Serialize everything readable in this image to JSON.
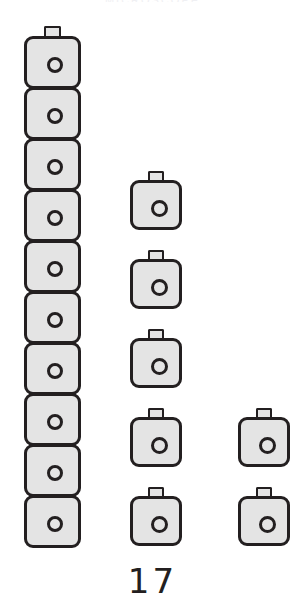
{
  "page": {
    "background_color": "#ffffff",
    "width": 305,
    "height": 613,
    "page_number": "17",
    "header_remnant": "MICROSCOPE"
  },
  "style": {
    "icon_fill": "#e4e4e4",
    "icon_stroke": "#231f20",
    "text_color": "#231f20"
  },
  "chart_data": {
    "type": "bar",
    "subtype": "pictograph",
    "title": "",
    "xlabel": "",
    "ylabel": "",
    "grid": false,
    "legend": null,
    "icon_name": "camera-icon",
    "icon_unit_value": 1,
    "orientation": "vertical",
    "categories": [
      "Column 1",
      "Column 2",
      "Column 3"
    ],
    "values": [
      10,
      5,
      2
    ],
    "ylim": [
      0,
      10
    ],
    "series": [
      {
        "name": "Count",
        "values": [
          10,
          5,
          2
        ]
      }
    ],
    "columns": [
      {
        "id": "col1",
        "label": "Column 1",
        "count": 10,
        "stacked": true,
        "tab_on_every_icon": false,
        "left": 24,
        "baseline_bottom": 548,
        "pitch": 51
      },
      {
        "id": "col2",
        "label": "Column 2",
        "count": 5,
        "stacked": false,
        "tab_on_every_icon": true,
        "left": 130,
        "baseline_bottom": 546,
        "pitch": 79
      },
      {
        "id": "col3",
        "label": "Column 3",
        "count": 2,
        "stacked": false,
        "tab_on_every_icon": true,
        "left": 238,
        "baseline_bottom": 546,
        "pitch": 79
      }
    ]
  }
}
